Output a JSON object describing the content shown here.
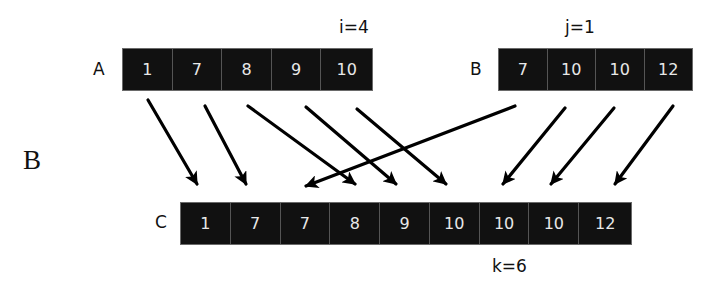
{
  "panel_label": "B",
  "arrays": {
    "A": {
      "name": "A",
      "values": [
        "1",
        "7",
        "8",
        "9",
        "10"
      ],
      "index_label": "i=4"
    },
    "B": {
      "name": "B",
      "values": [
        "7",
        "10",
        "10",
        "12"
      ],
      "index_label": "j=1"
    },
    "C": {
      "name": "C",
      "values": [
        "1",
        "7",
        "7",
        "8",
        "9",
        "10",
        "10",
        "10",
        "12"
      ],
      "index_label": "k=6"
    }
  },
  "arrows": [
    {
      "from": "A[0]=1",
      "to": "C[0]",
      "x1": 148,
      "y1": 100,
      "x2": 197,
      "y2": 184
    },
    {
      "from": "A[1]=7",
      "to": "C[1]",
      "x1": 205,
      "y1": 106,
      "x2": 246,
      "y2": 184
    },
    {
      "from": "A[2]=8",
      "to": "C[3]",
      "x1": 248,
      "y1": 106,
      "x2": 355,
      "y2": 184
    },
    {
      "from": "A[3]=9",
      "to": "C[4]",
      "x1": 306,
      "y1": 107,
      "x2": 396,
      "y2": 184
    },
    {
      "from": "A[4]=10",
      "to": "C[5]",
      "x1": 357,
      "y1": 109,
      "x2": 446,
      "y2": 184
    },
    {
      "from": "B[0]=7",
      "to": "C[2]",
      "x1": 515,
      "y1": 106,
      "x2": 306,
      "y2": 186
    },
    {
      "from": "B[1]=10",
      "to": "C[6]",
      "x1": 565,
      "y1": 108,
      "x2": 503,
      "y2": 184
    },
    {
      "from": "B[2]=10",
      "to": "C[7]",
      "x1": 614,
      "y1": 108,
      "x2": 551,
      "y2": 184
    },
    {
      "from": "B[3]=12",
      "to": "C[8]",
      "x1": 673,
      "y1": 106,
      "x2": 615,
      "y2": 184
    }
  ],
  "colors": {
    "cell_bg": "#111111",
    "cell_text": "#e8e8e8",
    "arrow": "#000000"
  }
}
